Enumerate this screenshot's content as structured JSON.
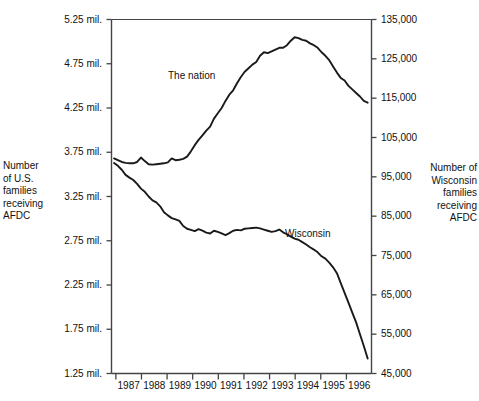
{
  "left_axis": {
    "title": "Number\nof U.S.\nfamilies\nreceiving\nAFDC",
    "ticks": [
      "5.25 mil.",
      "4.75 mil.",
      "4.25 mil.",
      "3.75 mil.",
      "3.25 mil.",
      "2.75 mil.",
      "2.25 mil.",
      "1.75 mil.",
      "1.25 mil."
    ]
  },
  "right_axis": {
    "title": "Number of\nWisconsin\nfamilies\nreceiving\nAFDC",
    "ticks": [
      "135,000",
      "125,000",
      "115,000",
      "105,000",
      "95,000",
      "85,000",
      "75,000",
      "65,000",
      "55,000",
      "45,000"
    ]
  },
  "x_axis": {
    "ticks": [
      "1987",
      "1988",
      "1989",
      "1990",
      "1991",
      "1992",
      "1993",
      "1994",
      "1995",
      "1996"
    ]
  },
  "series_labels": {
    "nation": "The nation",
    "wisconsin": "Wisconsin"
  },
  "colors": {
    "line": "#1a1a1a",
    "axis": "#444444",
    "background": "#ffffff",
    "text": "#111111"
  },
  "chart_data": {
    "type": "line",
    "title": "",
    "subtitle": "",
    "xlabel": "",
    "ylabel": "Number of U.S. families receiving AFDC",
    "y2label": "Number of Wisconsin families receiving AFDC",
    "grid": false,
    "legend": "inline-labels",
    "xlim": [
      1986.75,
      1996.9
    ],
    "ylim": [
      1250000,
      5250000
    ],
    "y2lim": [
      45000,
      135000
    ],
    "xticks": [
      1987,
      1988,
      1989,
      1990,
      1991,
      1992,
      1993,
      1994,
      1995,
      1996
    ],
    "yticks": [
      1250000,
      1750000,
      2250000,
      2750000,
      3250000,
      3750000,
      4250000,
      4750000,
      5250000
    ],
    "y2ticks": [
      45000,
      55000,
      65000,
      75000,
      85000,
      95000,
      105000,
      115000,
      125000,
      135000
    ],
    "series": [
      {
        "name": "The nation",
        "axis": "left",
        "units": "U.S. families",
        "x": [
          1986.85,
          1987.0,
          1987.15,
          1987.3,
          1987.45,
          1987.6,
          1987.75,
          1987.9,
          1988.05,
          1988.2,
          1988.35,
          1988.5,
          1988.65,
          1988.8,
          1988.95,
          1989.1,
          1989.25,
          1989.4,
          1989.55,
          1989.7,
          1989.85,
          1990.0,
          1990.15,
          1990.3,
          1990.45,
          1990.6,
          1990.75,
          1990.9,
          1991.05,
          1991.2,
          1991.35,
          1991.5,
          1991.65,
          1991.8,
          1991.95,
          1992.1,
          1992.25,
          1992.4,
          1992.55,
          1992.7,
          1992.85,
          1993.0,
          1993.15,
          1993.3,
          1993.45,
          1993.6,
          1993.75,
          1993.9,
          1994.05,
          1994.2,
          1994.35,
          1994.5,
          1994.65,
          1994.8,
          1994.95,
          1995.1,
          1995.25,
          1995.4,
          1995.55,
          1995.7,
          1995.85,
          1996.0,
          1996.15,
          1996.3,
          1996.45,
          1996.6,
          1996.75
        ],
        "y": [
          3680000,
          3660000,
          3640000,
          3630000,
          3625000,
          3625000,
          3640000,
          3690000,
          3650000,
          3615000,
          3610000,
          3615000,
          3620000,
          3625000,
          3635000,
          3680000,
          3660000,
          3665000,
          3675000,
          3700000,
          3760000,
          3830000,
          3890000,
          3940000,
          3995000,
          4040000,
          4130000,
          4190000,
          4250000,
          4330000,
          4400000,
          4450000,
          4530000,
          4600000,
          4660000,
          4700000,
          4740000,
          4770000,
          4840000,
          4880000,
          4870000,
          4890000,
          4910000,
          4930000,
          4930000,
          4960000,
          5010000,
          5050000,
          5040000,
          5020000,
          5010000,
          4980000,
          4960000,
          4930000,
          4880000,
          4840000,
          4790000,
          4720000,
          4650000,
          4590000,
          4560000,
          4500000,
          4460000,
          4420000,
          4380000,
          4330000,
          4310000
        ],
        "note": "Caseload flat near 3.6-3.7 million through 1989, rises steadily from 1990, peaks just above 5 million in early-to-mid 1994, then declines to about 4.3 million by late 1996."
      },
      {
        "name": "Wisconsin",
        "axis": "right",
        "units": "Wisconsin families",
        "x": [
          1986.85,
          1987.0,
          1987.15,
          1987.3,
          1987.45,
          1987.6,
          1987.75,
          1987.9,
          1988.05,
          1988.2,
          1988.35,
          1988.5,
          1988.65,
          1988.8,
          1988.95,
          1989.1,
          1989.25,
          1989.4,
          1989.55,
          1989.7,
          1989.85,
          1990.0,
          1990.15,
          1990.3,
          1990.45,
          1990.6,
          1990.75,
          1990.9,
          1991.05,
          1991.2,
          1991.35,
          1991.5,
          1991.65,
          1991.8,
          1991.95,
          1992.1,
          1992.25,
          1992.4,
          1992.55,
          1992.7,
          1992.85,
          1993.0,
          1993.15,
          1993.3,
          1993.45,
          1993.6,
          1993.75,
          1993.9,
          1994.05,
          1994.2,
          1994.35,
          1994.5,
          1994.65,
          1994.8,
          1994.95,
          1995.1,
          1995.25,
          1995.4,
          1995.55,
          1995.7,
          1995.85,
          1996.0,
          1996.15,
          1996.3,
          1996.45,
          1996.6,
          1996.75
        ],
        "y": [
          98500,
          97800,
          96800,
          95500,
          94800,
          94200,
          93200,
          92000,
          91200,
          90000,
          89000,
          88500,
          87500,
          86000,
          85200,
          84500,
          84200,
          83800,
          82500,
          81800,
          81500,
          81200,
          81700,
          81300,
          80800,
          80600,
          81300,
          81000,
          80600,
          80200,
          80700,
          81300,
          81500,
          81400,
          81800,
          81900,
          82000,
          82100,
          81900,
          81600,
          81300,
          81000,
          81200,
          81600,
          80900,
          80400,
          79800,
          79300,
          79000,
          78400,
          77800,
          77100,
          76500,
          75800,
          74800,
          74200,
          73200,
          72000,
          70500,
          68000,
          65500,
          63000,
          60500,
          58000,
          55000,
          52000,
          48800
        ],
        "note": "Steady decline from about 98,500 in early 1987 to roughly 80,000 by 1990, a plateau near 80,000-82,000 through 1993, then a sharp fall beginning in 1995 to about 48,500 by late 1996."
      }
    ]
  }
}
